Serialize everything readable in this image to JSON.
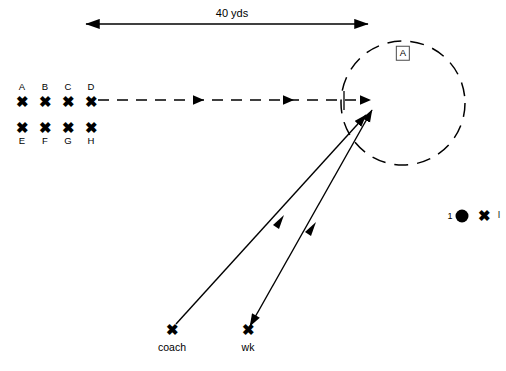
{
  "diagram": {
    "background_color": "#ffffff",
    "stroke_color": "#000000",
    "width": 506,
    "height": 371
  },
  "dimension": {
    "label": "40 yds",
    "x_start": 82,
    "x_end": 372,
    "y": 24,
    "text_x": 232,
    "text_y": 13
  },
  "zone": {
    "tag": "A",
    "center_x": 403,
    "center_y": 103,
    "radius": 62,
    "tag_x": 403,
    "tag_y": 53,
    "style": "dashed-circle"
  },
  "players": {
    "row_front": [
      {
        "label": "A",
        "x": 22,
        "y": 101,
        "label_x": 22,
        "label_y": 87
      },
      {
        "label": "B",
        "x": 45,
        "y": 101,
        "label_x": 45,
        "label_y": 87
      },
      {
        "label": "C",
        "x": 68,
        "y": 101,
        "label_x": 68,
        "label_y": 87
      },
      {
        "label": "D",
        "x": 91,
        "y": 101,
        "label_x": 91,
        "label_y": 87
      }
    ],
    "row_back": [
      {
        "label": "E",
        "x": 22,
        "y": 127,
        "label_x": 22,
        "label_y": 141
      },
      {
        "label": "F",
        "x": 45,
        "y": 127,
        "label_x": 45,
        "label_y": 141
      },
      {
        "label": "G",
        "x": 68,
        "y": 127,
        "label_x": 68,
        "label_y": 141
      },
      {
        "label": "H",
        "x": 91,
        "y": 127,
        "label_x": 91,
        "label_y": 141
      }
    ],
    "marker_glyph": "✖"
  },
  "staff": [
    {
      "name": "coach",
      "x": 172,
      "y": 329,
      "label_x": 172,
      "label_y": 346
    },
    {
      "name": "wk",
      "x": 248,
      "y": 329,
      "label_x": 248,
      "label_y": 346
    }
  ],
  "ball_station": {
    "count_label": "1",
    "count_x": 450,
    "count_y": 216,
    "ball_x": 462,
    "ball_y": 216,
    "marker_label": "✖",
    "marker_x": 484,
    "marker_y": 215,
    "edge_label": "l",
    "edge_x": 498,
    "edge_y": 215
  },
  "paths": {
    "run_route": {
      "name": "dashed run route",
      "x_start": 95,
      "y_start": 100,
      "x_end": 372,
      "y_end": 100,
      "style": "dashed",
      "arrowheads_at": [
        200,
        290,
        370
      ]
    },
    "coach_pass": {
      "name": "coach throw",
      "x_start": 176,
      "y_start": 324,
      "x_end": 368,
      "y_end": 113,
      "style": "solid",
      "mid_arrow_at": 0.52
    },
    "wk_pass": {
      "name": "wk throw and return",
      "x_start": 252,
      "y_start": 324,
      "x_end": 374,
      "y_end": 108,
      "style": "solid",
      "mid_arrow_at": 0.5,
      "double_ended": true
    }
  }
}
